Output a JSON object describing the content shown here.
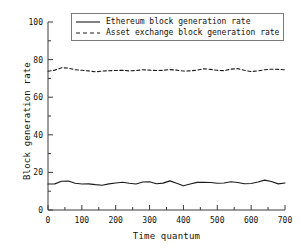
{
  "chart_data": {
    "type": "line",
    "title": "",
    "xlabel": "Time quantum",
    "ylabel": "Block generation rate",
    "xlim": [
      0,
      700
    ],
    "ylim": [
      0,
      100
    ],
    "xticks": [
      0,
      100,
      200,
      300,
      400,
      500,
      600,
      700
    ],
    "yticks": [
      0,
      20,
      40,
      60,
      80,
      100
    ],
    "xtick_labels": [
      "0",
      "100",
      "200",
      "300",
      "400",
      "500",
      "600",
      "700"
    ],
    "ytick_labels": [
      "0",
      "20",
      "40",
      "60",
      "80",
      "100"
    ],
    "x_minor_interval": 50,
    "y_minor_interval": 10,
    "grid": false,
    "legend_position": "upper center",
    "series": [
      {
        "name": "Ethereum block generation rate",
        "style": "solid",
        "color": "#1a1a1a",
        "x": [
          0,
          20,
          40,
          60,
          80,
          100,
          120,
          140,
          160,
          180,
          200,
          220,
          240,
          260,
          280,
          300,
          320,
          340,
          360,
          380,
          400,
          420,
          440,
          460,
          480,
          500,
          520,
          540,
          560,
          580,
          600,
          620,
          640,
          660,
          680,
          700
        ],
        "values": [
          13.8,
          13.9,
          15.3,
          15.4,
          14.2,
          13.8,
          13.9,
          13.5,
          13.2,
          13.9,
          14.4,
          14.8,
          14.2,
          13.8,
          14.9,
          15.0,
          14.0,
          14.3,
          15.5,
          14.2,
          12.9,
          13.8,
          14.7,
          14.8,
          14.6,
          14.2,
          14.4,
          15.0,
          14.6,
          14.0,
          14.1,
          14.9,
          15.9,
          15.2,
          13.9,
          14.4
        ]
      },
      {
        "name": "Asset exchange block generation rate",
        "style": "dashed",
        "color": "#1a1a1a",
        "x": [
          0,
          20,
          40,
          60,
          80,
          100,
          120,
          140,
          160,
          180,
          200,
          220,
          240,
          260,
          280,
          300,
          320,
          340,
          360,
          380,
          400,
          420,
          440,
          460,
          480,
          500,
          520,
          540,
          560,
          580,
          600,
          620,
          640,
          660,
          680,
          700
        ],
        "values": [
          73.8,
          74.4,
          75.7,
          75.5,
          74.6,
          74.3,
          74.0,
          73.5,
          73.9,
          74.1,
          74.2,
          74.3,
          74.0,
          74.2,
          74.6,
          74.4,
          74.2,
          74.3,
          74.7,
          74.4,
          73.9,
          74.0,
          74.4,
          75.1,
          74.8,
          74.3,
          74.1,
          74.9,
          75.2,
          74.3,
          73.6,
          74.0,
          74.6,
          74.9,
          74.8,
          74.6
        ]
      }
    ]
  },
  "legend": {
    "entries": [
      {
        "label": "Ethereum block generation rate",
        "style": "solid"
      },
      {
        "label": "Asset exchange block generation rate",
        "style": "dashed"
      }
    ]
  },
  "axes": {
    "x_title": "Time quantum",
    "y_title": "Block generation rate"
  }
}
